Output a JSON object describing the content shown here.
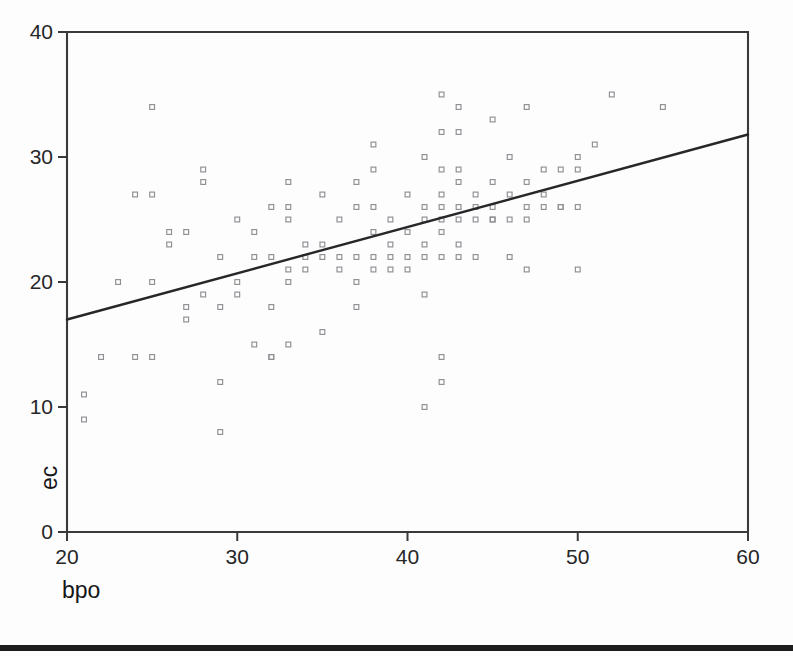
{
  "chart_data": {
    "type": "scatter",
    "title": "",
    "xlabel": "bpo",
    "ylabel": "ec",
    "xlim": [
      20,
      60
    ],
    "ylim": [
      0,
      40
    ],
    "xticks": [
      20,
      30,
      40,
      50,
      60
    ],
    "yticks": [
      0,
      10,
      20,
      30,
      40
    ],
    "xtick_labels": [
      "20",
      "30",
      "40",
      "50",
      "60"
    ],
    "ytick_labels": [
      "0",
      "10",
      "20",
      "30",
      "40"
    ],
    "grid": false,
    "legend": null,
    "marker": "open-square",
    "marker_color": "#8e8e93",
    "line_color": "#27272a",
    "series": [
      {
        "name": "observations",
        "points": [
          [
            21,
            11
          ],
          [
            21,
            9
          ],
          [
            22,
            14
          ],
          [
            23,
            20
          ],
          [
            24,
            27
          ],
          [
            24,
            14
          ],
          [
            25,
            34
          ],
          [
            25,
            27
          ],
          [
            25,
            20
          ],
          [
            25,
            14
          ],
          [
            26,
            23
          ],
          [
            26,
            24
          ],
          [
            27,
            18
          ],
          [
            27,
            24
          ],
          [
            27,
            17
          ],
          [
            28,
            29
          ],
          [
            28,
            28
          ],
          [
            28,
            19
          ],
          [
            29,
            22
          ],
          [
            29,
            18
          ],
          [
            29,
            12
          ],
          [
            29,
            8
          ],
          [
            30,
            20
          ],
          [
            30,
            25
          ],
          [
            30,
            19
          ],
          [
            31,
            24
          ],
          [
            31,
            22
          ],
          [
            31,
            15
          ],
          [
            32,
            26
          ],
          [
            32,
            22
          ],
          [
            32,
            18
          ],
          [
            32,
            14
          ],
          [
            32,
            14
          ],
          [
            33,
            28
          ],
          [
            33,
            26
          ],
          [
            33,
            25
          ],
          [
            33,
            21
          ],
          [
            33,
            20
          ],
          [
            33,
            15
          ],
          [
            34,
            23
          ],
          [
            34,
            22
          ],
          [
            34,
            21
          ],
          [
            35,
            27
          ],
          [
            35,
            23
          ],
          [
            35,
            22
          ],
          [
            35,
            16
          ],
          [
            36,
            25
          ],
          [
            36,
            22
          ],
          [
            36,
            21
          ],
          [
            37,
            28
          ],
          [
            37,
            26
          ],
          [
            37,
            22
          ],
          [
            37,
            20
          ],
          [
            37,
            18
          ],
          [
            38,
            31
          ],
          [
            38,
            29
          ],
          [
            38,
            26
          ],
          [
            38,
            24
          ],
          [
            38,
            22
          ],
          [
            38,
            21
          ],
          [
            39,
            25
          ],
          [
            39,
            23
          ],
          [
            39,
            22
          ],
          [
            39,
            21
          ],
          [
            40,
            27
          ],
          [
            40,
            24
          ],
          [
            40,
            22
          ],
          [
            40,
            21
          ],
          [
            41,
            30
          ],
          [
            41,
            26
          ],
          [
            41,
            25
          ],
          [
            41,
            23
          ],
          [
            41,
            22
          ],
          [
            41,
            19
          ],
          [
            41,
            10
          ],
          [
            42,
            35
          ],
          [
            42,
            32
          ],
          [
            42,
            29
          ],
          [
            42,
            27
          ],
          [
            42,
            26
          ],
          [
            42,
            25
          ],
          [
            42,
            24
          ],
          [
            42,
            22
          ],
          [
            42,
            14
          ],
          [
            42,
            12
          ],
          [
            43,
            34
          ],
          [
            43,
            32
          ],
          [
            43,
            29
          ],
          [
            43,
            28
          ],
          [
            43,
            26
          ],
          [
            43,
            25
          ],
          [
            43,
            23
          ],
          [
            43,
            22
          ],
          [
            44,
            27
          ],
          [
            44,
            26
          ],
          [
            44,
            25
          ],
          [
            44,
            22
          ],
          [
            45,
            33
          ],
          [
            45,
            28
          ],
          [
            45,
            26
          ],
          [
            45,
            25
          ],
          [
            45,
            25
          ],
          [
            46,
            30
          ],
          [
            46,
            27
          ],
          [
            46,
            25
          ],
          [
            46,
            22
          ],
          [
            47,
            34
          ],
          [
            47,
            28
          ],
          [
            47,
            26
          ],
          [
            47,
            25
          ],
          [
            47,
            21
          ],
          [
            48,
            29
          ],
          [
            48,
            27
          ],
          [
            48,
            26
          ],
          [
            49,
            29
          ],
          [
            49,
            26
          ],
          [
            49,
            26
          ],
          [
            50,
            30
          ],
          [
            50,
            29
          ],
          [
            50,
            26
          ],
          [
            50,
            21
          ],
          [
            51,
            31
          ],
          [
            52,
            35
          ],
          [
            55,
            34
          ]
        ]
      }
    ],
    "fit_line": {
      "name": "regression-line",
      "x_start": 20,
      "y_start": 17,
      "x_end": 60,
      "y_end": 31.8
    }
  },
  "footer": {
    "bar_color": "#1e1e20"
  }
}
